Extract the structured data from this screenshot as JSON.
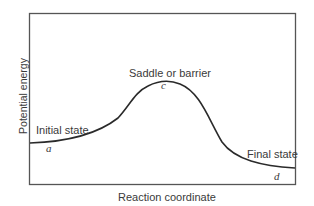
{
  "diagram": {
    "type": "potential-energy-profile",
    "axes": {
      "xlabel": "Reaction coordinate",
      "ylabel": "Potential energy"
    },
    "annotations": {
      "initial_state": "Initial state",
      "saddle": "Saddle or barrier",
      "final_state": "Final state"
    },
    "points": {
      "a": "a",
      "c": "c",
      "d": "d"
    },
    "colors": {
      "line": "#2a2a2a",
      "frame": "#555555",
      "background": "#ffffff"
    }
  }
}
